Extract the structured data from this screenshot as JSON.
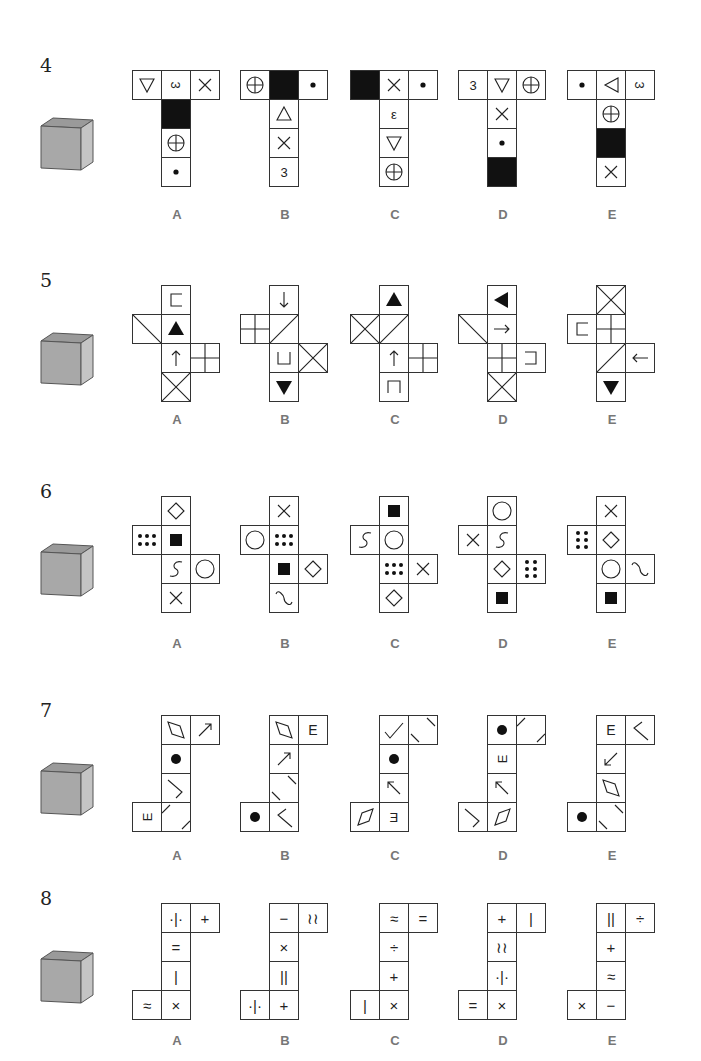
{
  "questions": [
    {
      "number": "4",
      "cube": {
        "top": "black",
        "front": "circle-plus",
        "right": "triangle-up"
      },
      "options": [
        {
          "label": "A",
          "cells": [
            [
              0,
              0,
              "tri-down"
            ],
            [
              1,
              0,
              "3-rot"
            ],
            [
              2,
              0,
              "x"
            ],
            [
              1,
              1,
              "black"
            ],
            [
              1,
              2,
              "circle-plus"
            ],
            [
              1,
              3,
              "dot"
            ]
          ]
        },
        {
          "label": "B",
          "cells": [
            [
              0,
              0,
              "circle-plus"
            ],
            [
              1,
              0,
              "black"
            ],
            [
              2,
              0,
              "dot"
            ],
            [
              1,
              1,
              "tri-up"
            ],
            [
              1,
              2,
              "x"
            ],
            [
              1,
              3,
              "3"
            ]
          ]
        },
        {
          "label": "C",
          "cells": [
            [
              0,
              0,
              "black"
            ],
            [
              1,
              0,
              "x"
            ],
            [
              2,
              0,
              "dot"
            ],
            [
              1,
              1,
              "epsilon"
            ],
            [
              1,
              2,
              "tri-down"
            ],
            [
              1,
              3,
              "circle-plus"
            ]
          ]
        },
        {
          "label": "D",
          "cells": [
            [
              0,
              0,
              "3"
            ],
            [
              1,
              0,
              "tri-down"
            ],
            [
              2,
              0,
              "circle-plus"
            ],
            [
              1,
              1,
              "x"
            ],
            [
              1,
              2,
              "dot"
            ],
            [
              1,
              3,
              "black"
            ]
          ]
        },
        {
          "label": "E",
          "cells": [
            [
              0,
              0,
              "dot"
            ],
            [
              1,
              0,
              "tri-left"
            ],
            [
              2,
              0,
              "3-rot"
            ],
            [
              1,
              1,
              "circle-plus"
            ],
            [
              1,
              2,
              "black"
            ],
            [
              1,
              3,
              "x"
            ]
          ]
        }
      ]
    },
    {
      "number": "5",
      "cube": {
        "top": "roof-lines",
        "front": "arrow-up",
        "right": "grid-4"
      },
      "options": [
        {
          "label": "A",
          "cells": [
            [
              1,
              0,
              "bracket-left"
            ],
            [
              0,
              1,
              "diag-tl-br"
            ],
            [
              1,
              1,
              "tri-fill-up"
            ],
            [
              1,
              2,
              "arrow-up"
            ],
            [
              2,
              2,
              "grid-4"
            ],
            [
              1,
              3,
              "x-full"
            ]
          ]
        },
        {
          "label": "B",
          "cells": [
            [
              1,
              0,
              "arrow-down"
            ],
            [
              0,
              1,
              "grid-4"
            ],
            [
              1,
              1,
              "diag-bl-tr"
            ],
            [
              1,
              2,
              "bracket-u"
            ],
            [
              2,
              2,
              "x-full"
            ],
            [
              1,
              3,
              "tri-fill-down"
            ]
          ]
        },
        {
          "label": "C",
          "cells": [
            [
              1,
              0,
              "tri-fill-up"
            ],
            [
              0,
              1,
              "x-full"
            ],
            [
              1,
              1,
              "diag-bl-tr"
            ],
            [
              1,
              2,
              "arrow-up"
            ],
            [
              2,
              2,
              "grid-4"
            ],
            [
              1,
              3,
              "bracket-n"
            ]
          ]
        },
        {
          "label": "D",
          "cells": [
            [
              1,
              0,
              "tri-fill-left"
            ],
            [
              0,
              1,
              "diag-tl-br"
            ],
            [
              1,
              1,
              "arrow-right"
            ],
            [
              1,
              2,
              "grid-4"
            ],
            [
              2,
              2,
              "bracket-right"
            ],
            [
              1,
              3,
              "x-full"
            ]
          ]
        },
        {
          "label": "E",
          "cells": [
            [
              1,
              0,
              "x-full"
            ],
            [
              0,
              1,
              "bracket-left"
            ],
            [
              1,
              1,
              "grid-4"
            ],
            [
              1,
              2,
              "diag-bl-tr"
            ],
            [
              2,
              2,
              "arrow-left"
            ],
            [
              1,
              3,
              "tri-fill-down"
            ]
          ]
        }
      ]
    },
    {
      "number": "6",
      "cube": {
        "top": "square-fill",
        "front": "diamond",
        "right": "dots-6"
      },
      "options": [
        {
          "label": "A",
          "cells": [
            [
              1,
              0,
              "diamond"
            ],
            [
              0,
              1,
              "dots-6"
            ],
            [
              1,
              1,
              "square-fill"
            ],
            [
              1,
              2,
              "s-curve"
            ],
            [
              2,
              2,
              "circle"
            ],
            [
              1,
              3,
              "x"
            ]
          ]
        },
        {
          "label": "B",
          "cells": [
            [
              1,
              0,
              "x"
            ],
            [
              0,
              1,
              "circle"
            ],
            [
              1,
              1,
              "dots-6"
            ],
            [
              1,
              2,
              "square-fill"
            ],
            [
              2,
              2,
              "diamond"
            ],
            [
              1,
              3,
              "s-curve-h"
            ]
          ]
        },
        {
          "label": "C",
          "cells": [
            [
              1,
              0,
              "square-fill"
            ],
            [
              0,
              1,
              "s-curve"
            ],
            [
              1,
              1,
              "circle"
            ],
            [
              1,
              2,
              "dots-6"
            ],
            [
              2,
              2,
              "x"
            ],
            [
              1,
              3,
              "diamond"
            ]
          ]
        },
        {
          "label": "D",
          "cells": [
            [
              1,
              0,
              "circle"
            ],
            [
              0,
              1,
              "x"
            ],
            [
              1,
              1,
              "s-curve"
            ],
            [
              1,
              2,
              "diamond"
            ],
            [
              2,
              2,
              "dots-6v"
            ],
            [
              1,
              3,
              "square-fill"
            ]
          ]
        },
        {
          "label": "E",
          "cells": [
            [
              1,
              0,
              "x"
            ],
            [
              0,
              1,
              "dots-6v"
            ],
            [
              1,
              1,
              "diamond"
            ],
            [
              1,
              2,
              "circle"
            ],
            [
              2,
              2,
              "s-curve-h"
            ],
            [
              1,
              3,
              "square-fill"
            ]
          ]
        }
      ]
    },
    {
      "number": "7",
      "cube": {
        "top": "ellipse-fill",
        "front": "parallelogram",
        "right": "arrow-ul"
      },
      "options": [
        {
          "label": "A",
          "cells": [
            [
              1,
              0,
              "parallelogram-v"
            ],
            [
              2,
              0,
              "arrow-ur"
            ],
            [
              1,
              1,
              "dot-big"
            ],
            [
              1,
              2,
              "chevron-right"
            ],
            [
              0,
              3,
              "E-down"
            ],
            [
              1,
              3,
              "corners-tl-br"
            ]
          ]
        },
        {
          "label": "B",
          "cells": [
            [
              1,
              0,
              "parallelogram-v"
            ],
            [
              2,
              0,
              "E"
            ],
            [
              1,
              1,
              "arrow-ur"
            ],
            [
              1,
              2,
              "corners-tr-bl"
            ],
            [
              0,
              3,
              "dot-big"
            ],
            [
              1,
              3,
              "chevron-left"
            ]
          ]
        },
        {
          "label": "C",
          "cells": [
            [
              1,
              0,
              "check"
            ],
            [
              2,
              0,
              "corners-tr-bl"
            ],
            [
              1,
              1,
              "dot-big"
            ],
            [
              1,
              2,
              "arrow-ul"
            ],
            [
              0,
              3,
              "parallelogram-h"
            ],
            [
              1,
              3,
              "E-rev"
            ]
          ]
        },
        {
          "label": "D",
          "cells": [
            [
              1,
              0,
              "dot-big"
            ],
            [
              2,
              0,
              "corners-tl-br"
            ],
            [
              1,
              1,
              "E-down"
            ],
            [
              1,
              2,
              "arrow-ul"
            ],
            [
              0,
              3,
              "chevron-right"
            ],
            [
              1,
              3,
              "parallelogram-h"
            ]
          ]
        },
        {
          "label": "E",
          "cells": [
            [
              1,
              0,
              "E"
            ],
            [
              2,
              0,
              "chevron-left"
            ],
            [
              1,
              1,
              "arrow-dl"
            ],
            [
              1,
              2,
              "parallelogram-v"
            ],
            [
              0,
              3,
              "dot-big"
            ],
            [
              1,
              3,
              "corners-tr-bl"
            ]
          ]
        }
      ]
    },
    {
      "number": "8",
      "cube": {
        "top": "dot-bar-dot",
        "front": "equals",
        "right": "x"
      },
      "options": [
        {
          "label": "A",
          "cells": [
            [
              1,
              0,
              "·|·"
            ],
            [
              2,
              0,
              "+"
            ],
            [
              1,
              1,
              "="
            ],
            [
              1,
              2,
              "|"
            ],
            [
              0,
              3,
              "≈"
            ],
            [
              1,
              3,
              "×"
            ]
          ]
        },
        {
          "label": "B",
          "cells": [
            [
              1,
              0,
              "−"
            ],
            [
              2,
              0,
              "≀≀"
            ],
            [
              1,
              1,
              "×"
            ],
            [
              1,
              2,
              "||"
            ],
            [
              0,
              3,
              "·|·"
            ],
            [
              1,
              3,
              "+"
            ]
          ]
        },
        {
          "label": "C",
          "cells": [
            [
              1,
              0,
              "≈"
            ],
            [
              2,
              0,
              "="
            ],
            [
              1,
              1,
              "÷"
            ],
            [
              1,
              2,
              "+"
            ],
            [
              0,
              3,
              "|"
            ],
            [
              1,
              3,
              "×"
            ]
          ]
        },
        {
          "label": "D",
          "cells": [
            [
              1,
              0,
              "+"
            ],
            [
              2,
              0,
              "|"
            ],
            [
              1,
              1,
              "≀≀"
            ],
            [
              1,
              2,
              "·|·"
            ],
            [
              0,
              3,
              "="
            ],
            [
              1,
              3,
              "×"
            ]
          ]
        },
        {
          "label": "E",
          "cells": [
            [
              1,
              0,
              "||"
            ],
            [
              2,
              0,
              "÷"
            ],
            [
              1,
              1,
              "+"
            ],
            [
              1,
              2,
              "≈"
            ],
            [
              0,
              3,
              "×"
            ],
            [
              1,
              3,
              "−"
            ]
          ]
        }
      ]
    }
  ]
}
